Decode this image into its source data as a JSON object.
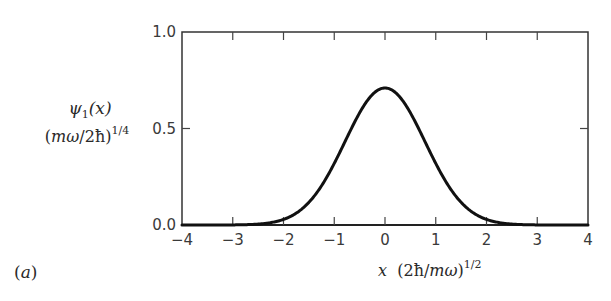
{
  "chart_data": {
    "type": "line",
    "title": "",
    "panel_label": "(a)",
    "xlabel": "x (2ħ/mω)^{1/2}",
    "ylabel": "ψ1(x) (mω/2ħ)^{1/4}",
    "xlim": [
      -4,
      4
    ],
    "ylim": [
      0.0,
      1.0
    ],
    "x_ticks": [
      -4,
      -3,
      -2,
      -1,
      0,
      1,
      2,
      3,
      4
    ],
    "x_tick_labels": [
      "−4",
      "−3",
      "−2",
      "−1",
      "0",
      "1",
      "2",
      "3",
      "4"
    ],
    "y_ticks": [
      0.0,
      0.5,
      1.0
    ],
    "y_tick_labels": [
      "0.0",
      "0.5",
      "1.0"
    ],
    "grid": false,
    "legend": null,
    "series": [
      {
        "name": "ψ1(x)",
        "color": "#111111",
        "x": [
          -4.0,
          -3.5,
          -3.0,
          -2.5,
          -2.0,
          -1.75,
          -1.5,
          -1.25,
          -1.0,
          -0.75,
          -0.5,
          -0.25,
          0.0,
          0.25,
          0.5,
          0.75,
          1.0,
          1.25,
          1.5,
          1.75,
          2.0,
          2.5,
          3.0,
          3.5,
          4.0
        ],
        "y": [
          0.0,
          0.0,
          0.0,
          0.002,
          0.029,
          0.061,
          0.116,
          0.203,
          0.318,
          0.452,
          0.58,
          0.675,
          0.71,
          0.675,
          0.58,
          0.452,
          0.318,
          0.203,
          0.116,
          0.061,
          0.029,
          0.002,
          0.0,
          0.0,
          0.0
        ]
      }
    ]
  },
  "labels": {
    "ylabel_psi": "ψ",
    "ylabel_sub": "1",
    "ylabel_arg": "(x)",
    "ylabel_scale_open": "(",
    "ylabel_scale_m": "mω",
    "ylabel_scale_rest": "/2ħ)",
    "ylabel_scale_exp": "1/4",
    "xlabel_var": "x",
    "xlabel_scale_open": "(2ħ/",
    "xlabel_scale_m": "mω",
    "xlabel_scale_close": ")",
    "xlabel_scale_exp": "1/2",
    "panel_open": "(",
    "panel_letter": "a",
    "panel_close": ")"
  }
}
